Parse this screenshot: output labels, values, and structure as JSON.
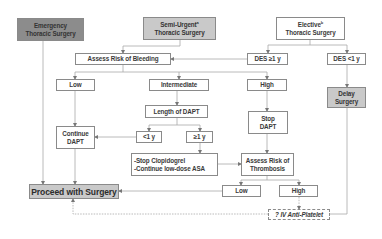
{
  "diagram": {
    "type": "flowchart",
    "nodes": {
      "emergency": {
        "line1": "Emergency",
        "line2": "Thoracic Surgery"
      },
      "semi_urgent": {
        "line1": "Semi-Urgent",
        "sup": "a",
        "line2": "Thoracic Surgery"
      },
      "elective": {
        "line1": "Elective",
        "sup": "b",
        "line2": "Thoracic Surgery"
      },
      "assess_bleeding": {
        "label": "Assess Risk of Bleeding"
      },
      "des_ge1": {
        "label": "DES ≥1 y"
      },
      "des_lt1": {
        "label": "DES <1 y"
      },
      "bleed_low": {
        "label": "Low"
      },
      "bleed_intermediate": {
        "label": "Intermediate"
      },
      "bleed_high": {
        "label": "High"
      },
      "delay_surgery": {
        "line1": "Delay",
        "line2": "Surgery"
      },
      "length_dapt": {
        "label": "Length of DAPT"
      },
      "stop_dapt": {
        "line1": "Stop",
        "line2": "DAPT"
      },
      "continue_dapt": {
        "line1": "Continue",
        "line2": "DAPT"
      },
      "lt1y": {
        "label": "<1 y"
      },
      "ge1y": {
        "label": "≥1 y"
      },
      "stop_clopidogrel": {
        "line1": "-Stop Clopidogrel",
        "line2": "-Continue low-dose ASA"
      },
      "assess_thrombosis": {
        "line1": "Assess Risk of",
        "line2": "Thrombosis"
      },
      "proceed": {
        "label": "Proceed with Surgery"
      },
      "thromb_low": {
        "label": "Low"
      },
      "thromb_high": {
        "label": "High"
      },
      "iv_antiplatelet": {
        "label": "? IV Anti-Platelet"
      }
    },
    "edges": [
      {
        "from": "emergency",
        "to": "proceed"
      },
      {
        "from": "semi_urgent",
        "to": "assess_bleeding"
      },
      {
        "from": "elective",
        "to": "des_ge1"
      },
      {
        "from": "elective",
        "to": "des_lt1"
      },
      {
        "from": "des_ge1",
        "to": "assess_bleeding"
      },
      {
        "from": "des_lt1",
        "to": "delay_surgery"
      },
      {
        "from": "assess_bleeding",
        "to": "bleed_low"
      },
      {
        "from": "assess_bleeding",
        "to": "bleed_intermediate"
      },
      {
        "from": "assess_bleeding",
        "to": "bleed_high"
      },
      {
        "from": "bleed_low",
        "to": "continue_dapt"
      },
      {
        "from": "bleed_intermediate",
        "to": "length_dapt"
      },
      {
        "from": "bleed_high",
        "to": "stop_dapt"
      },
      {
        "from": "length_dapt",
        "to": "lt1y"
      },
      {
        "from": "length_dapt",
        "to": "ge1y"
      },
      {
        "from": "lt1y",
        "to": "continue_dapt"
      },
      {
        "from": "ge1y",
        "to": "stop_clopidogrel"
      },
      {
        "from": "stop_clopidogrel",
        "to": "assess_thrombosis"
      },
      {
        "from": "stop_dapt",
        "to": "assess_thrombosis"
      },
      {
        "from": "continue_dapt",
        "to": "proceed"
      },
      {
        "from": "assess_thrombosis",
        "to": "thromb_low"
      },
      {
        "from": "assess_thrombosis",
        "to": "thromb_high"
      },
      {
        "from": "thromb_low",
        "to": "proceed"
      },
      {
        "from": "thromb_high",
        "to": "iv_antiplatelet",
        "style": "dashed"
      },
      {
        "from": "iv_antiplatelet",
        "to": "proceed",
        "style": "dashed"
      },
      {
        "from": "delay_surgery",
        "to": "iv_antiplatelet"
      }
    ],
    "colors": {
      "dark_box": "#8c8c8c",
      "mid_box": "#c9c9c9",
      "border": "#8a8a8a",
      "line": "#a8a8a8",
      "text": "#3a3a3a"
    }
  }
}
